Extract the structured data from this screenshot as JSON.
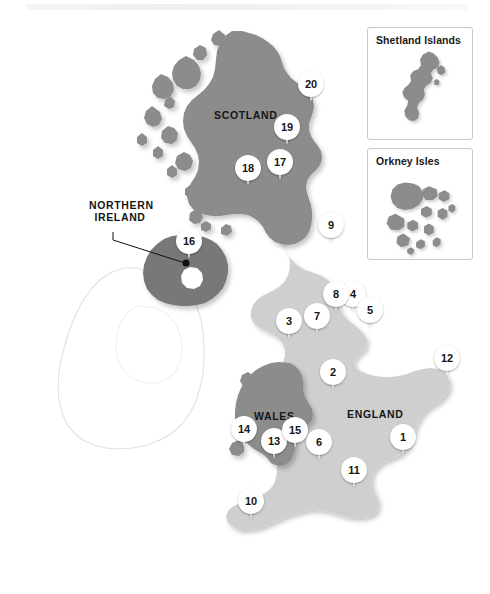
{
  "map": {
    "title": "United Kingdom regional map",
    "region_labels": [
      {
        "id": "scotland",
        "text": "SCOTLAND"
      },
      {
        "id": "england",
        "text": "ENGLAND"
      },
      {
        "id": "wales",
        "text": "WALES"
      },
      {
        "id": "nireland",
        "text": "NORTHERN IRELAND"
      }
    ],
    "insets": [
      {
        "id": "shetland",
        "title": "Shetland Islands"
      },
      {
        "id": "orkney",
        "title": "Orkney Isles"
      }
    ],
    "markers": [
      {
        "n": "1",
        "x": 403,
        "y": 457
      },
      {
        "n": "2",
        "x": 333,
        "y": 392
      },
      {
        "n": "3",
        "x": 289,
        "y": 341
      },
      {
        "n": "4",
        "x": 353,
        "y": 314
      },
      {
        "n": "5",
        "x": 370,
        "y": 330
      },
      {
        "n": "6",
        "x": 319,
        "y": 462
      },
      {
        "n": "7",
        "x": 317,
        "y": 336
      },
      {
        "n": "8",
        "x": 336,
        "y": 314
      },
      {
        "n": "9",
        "x": 331,
        "y": 245
      },
      {
        "n": "10",
        "x": 251,
        "y": 521
      },
      {
        "n": "11",
        "x": 354,
        "y": 490
      },
      {
        "n": "12",
        "x": 447,
        "y": 378
      },
      {
        "n": "13",
        "x": 274,
        "y": 461
      },
      {
        "n": "14",
        "x": 244,
        "y": 449
      },
      {
        "n": "15",
        "x": 295,
        "y": 450
      },
      {
        "n": "16",
        "x": 189,
        "y": 261
      },
      {
        "n": "17",
        "x": 280,
        "y": 182
      },
      {
        "n": "18",
        "x": 248,
        "y": 188
      },
      {
        "n": "19",
        "x": 287,
        "y": 147
      },
      {
        "n": "20",
        "x": 311,
        "y": 104
      }
    ],
    "colors": {
      "scotland_fill": "#8c8c8c",
      "wales_fill": "#8c8c8c",
      "nireland_fill": "#787878",
      "england_fill": "#cfcfcf",
      "ireland_fill": "#ffffff",
      "ireland_stroke": "#dcdcdc",
      "inset_border": "#c9c9c9",
      "pin_fill": "#ffffff",
      "text": "#151515",
      "background": "#ffffff"
    }
  }
}
